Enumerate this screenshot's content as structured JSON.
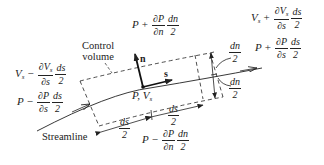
{
  "diagram": {
    "labels": {
      "control_volume": [
        "Control",
        "volume"
      ],
      "streamline": "Streamline",
      "center_point": "P, V",
      "center_point_sub": "s",
      "axis_n": "n",
      "axis_s": "s"
    },
    "equations": {
      "top": {
        "base": "P",
        "op": "+",
        "num": "∂P",
        "den": "∂n",
        "num2": "dn",
        "den2": "2"
      },
      "bottom": {
        "base": "P",
        "op": "−",
        "num": "∂P",
        "den": "∂n",
        "num2": "dn",
        "den2": "2"
      },
      "left_velocity": {
        "base": "V",
        "sub": "s",
        "op": "−",
        "num": "∂V",
        "numsub": "s",
        "den": "∂s",
        "num2": "ds",
        "den2": "2"
      },
      "left_pressure": {
        "base": "P",
        "op": "−",
        "num": "∂P",
        "den": "∂s",
        "num2": "ds",
        "den2": "2"
      },
      "right_velocity": {
        "base": "V",
        "sub": "s",
        "op": "+",
        "num": "∂V",
        "numsub": "s",
        "den": "∂s",
        "num2": "ds",
        "den2": "2"
      },
      "right_pressure": {
        "base": "P",
        "op": "+",
        "num": "∂P",
        "den": "∂s",
        "num2": "ds",
        "den2": "2"
      }
    },
    "dimensions": {
      "dn_half_top": {
        "num": "dn",
        "den": "2"
      },
      "dn_half_bottom": {
        "num": "dn",
        "den": "2"
      },
      "ds_half_left": {
        "num": "ds",
        "den": "2"
      },
      "ds_half_right": {
        "num": "ds",
        "den": "2"
      }
    },
    "colors": {
      "ink": "#222222",
      "background": "#ffffff"
    }
  }
}
